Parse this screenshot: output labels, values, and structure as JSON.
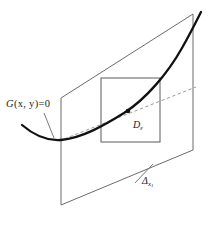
{
  "figure": {
    "kind": "3d-geometry-diagram",
    "background_color": "#ffffff",
    "width": 223,
    "height": 231,
    "labels": {
      "curve_equation_fn": "G",
      "curve_equation_args": "(x, y)",
      "curve_equation_rhs": "=0",
      "curve_equation_full": "G(x, y)=0",
      "domain_symbol": "D",
      "domain_subscript": "ε",
      "plane_symbol": "Δ",
      "plane_subscript": "x",
      "plane_subsubscript": "1"
    },
    "colors": {
      "curve_stroke": "#111111",
      "plane_stroke": "#6b6b6b",
      "square_stroke": "#5a5a5a",
      "dashed_stroke": "#9a9a9a",
      "leader_stroke": "#6b6b6b",
      "point_fill": "#111111",
      "text": "#1a1a1a"
    },
    "geometry": {
      "plane_polygon": "61,98 193,14 193,150 61,205",
      "square_rect": {
        "x": 101,
        "y": 78,
        "width": 59,
        "height": 64
      },
      "curve_path": "M 22,125 C 36,137 48,141 61,140 C 82,138 103,126 124,113 C 146,99 168,73 182,48 C 190,34 196,22 201,12",
      "dashed_path": "M 59,141 L 196,87",
      "point": {
        "x": 128,
        "y": 111,
        "r": 2.3
      },
      "leader_curve": "M 44,113 L 54,138",
      "leader_plane": "M 136,182 L 152,166"
    }
  }
}
